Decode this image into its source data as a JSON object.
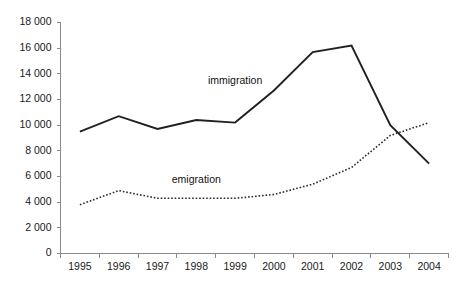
{
  "chart_data": {
    "type": "line",
    "title": "",
    "subtitle": "",
    "xlabel": "",
    "ylabel": "",
    "categories": [
      "1995",
      "1996",
      "1997",
      "1998",
      "1999",
      "2000",
      "2001",
      "2002",
      "2003",
      "2004"
    ],
    "ylim": [
      0,
      18000
    ],
    "ytick_values": [
      0,
      2000,
      4000,
      6000,
      8000,
      10000,
      12000,
      14000,
      16000,
      18000
    ],
    "ytick_labels": [
      "0",
      "2 000",
      "4 000",
      "6 000",
      "8 000",
      "10 000",
      "12 000",
      "14 000",
      "16 000",
      "18 000"
    ],
    "grid": false,
    "legend_position": "inline-annotation",
    "series": [
      {
        "name": "immigration",
        "style": "solid",
        "color": "#221f1f",
        "values": [
          9500,
          10700,
          9700,
          10400,
          10200,
          12700,
          15700,
          16200,
          10000,
          7000
        ],
        "annotation": {
          "label": "immigration",
          "x_category": "1999",
          "y_value": 13400
        }
      },
      {
        "name": "emigration",
        "style": "dotted",
        "color": "#2b2b2b",
        "values": [
          3800,
          4900,
          4300,
          4300,
          4300,
          4600,
          5400,
          6700,
          9200,
          10200
        ],
        "annotation": {
          "label": "emigration",
          "x_category": "1998",
          "y_value": 5700
        }
      }
    ]
  },
  "axes": {
    "y_axis_name": "value-axis",
    "x_axis_name": "year-axis"
  }
}
